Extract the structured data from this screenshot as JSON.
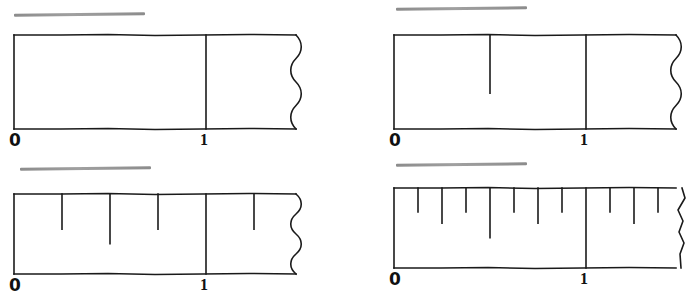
{
  "figure": {
    "kind": "number-line-ruler-worksheet",
    "background_color": "#ffffff",
    "ink_color": "#1a1a1a",
    "redaction_color": "#8c8c8c",
    "panel_count": 4
  },
  "panels": [
    {
      "id": "ruler-whole-units",
      "position": "top-left",
      "caption_redacted": true,
      "caption_text": "",
      "caption_bar": {
        "x": 14,
        "y": 13,
        "width": 131,
        "height": 3
      },
      "ruler": {
        "x": 13,
        "y": 33,
        "width": 283,
        "height": 94
      },
      "unit_mark_x": 205,
      "right_edge_style": "wavy",
      "subdivision": "whole",
      "subdivision_denominator": 1,
      "tick_fractions": [],
      "labels": {
        "zero": "0",
        "one": "1"
      },
      "label_zero_pos": {
        "x": 9,
        "y": 132
      },
      "label_one_pos": {
        "x": 200,
        "y": 132
      }
    },
    {
      "id": "ruler-halves",
      "position": "top-right",
      "caption_redacted": true,
      "caption_text": "",
      "caption_bar": {
        "x": 396,
        "y": 7,
        "width": 131,
        "height": 3
      },
      "ruler": {
        "x": 393,
        "y": 33,
        "width": 283,
        "height": 94
      },
      "unit_mark_x": 585,
      "right_edge_style": "wavy",
      "subdivision": "halves",
      "subdivision_denominator": 2,
      "tick_fractions": [
        0.5
      ],
      "labels": {
        "zero": "0",
        "one": "1"
      },
      "label_zero_pos": {
        "x": 389,
        "y": 132
      },
      "label_one_pos": {
        "x": 580,
        "y": 132
      }
    },
    {
      "id": "ruler-quarters",
      "position": "bottom-left",
      "caption_redacted": true,
      "caption_text": "",
      "caption_bar": {
        "x": 20,
        "y": 167,
        "width": 131,
        "height": 3
      },
      "ruler": {
        "x": 13,
        "y": 192,
        "width": 283,
        "height": 80
      },
      "unit_mark_x": 205,
      "right_edge_style": "wavy",
      "subdivision": "quarters",
      "subdivision_denominator": 4,
      "tick_fractions": [
        0.25,
        0.5,
        0.75,
        1.25
      ],
      "labels": {
        "zero": "0",
        "one": "1"
      },
      "label_zero_pos": {
        "x": 9,
        "y": 277
      },
      "label_one_pos": {
        "x": 200,
        "y": 277
      }
    },
    {
      "id": "ruler-eighths",
      "position": "bottom-right",
      "caption_redacted": true,
      "caption_text": "",
      "caption_bar": {
        "x": 396,
        "y": 163,
        "width": 131,
        "height": 3
      },
      "ruler": {
        "x": 393,
        "y": 186,
        "width": 283,
        "height": 80
      },
      "unit_mark_x": 585,
      "right_edge_style": "jagged",
      "subdivision": "eighths",
      "subdivision_denominator": 8,
      "tick_fractions": [
        0.125,
        0.25,
        0.375,
        0.5,
        0.625,
        0.75,
        0.875,
        1.125,
        1.25,
        1.375
      ],
      "labels": {
        "zero": "0",
        "one": "1"
      },
      "label_zero_pos": {
        "x": 389,
        "y": 271
      },
      "label_one_pos": {
        "x": 580,
        "y": 271
      }
    }
  ]
}
